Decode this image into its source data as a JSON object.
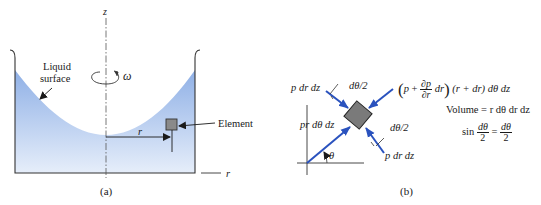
{
  "figure_a": {
    "axis_z_label": "z",
    "omega_label": "ω",
    "liquid_surface_label_line1": "Liquid",
    "liquid_surface_label_line2": "surface",
    "element_label": "Element",
    "radius_label": "r",
    "r_axis_label": "r",
    "caption": "(a)",
    "colors": {
      "liquid_top": "#8fb0e6",
      "liquid_bottom": "#e6eefa",
      "element_fill": "#8a8a8a",
      "outline": "#333333"
    }
  },
  "figure_b": {
    "force_upper_left": "p dr dz",
    "angle_upper": "dθ/2",
    "force_radial_inner": "pr dθ dz",
    "angle_lower": "dθ/2",
    "force_lower_right": "p dr dz",
    "theta_label": "θ",
    "outer_force": {
      "p": "p",
      "plus": "+",
      "partial_num": "∂p",
      "partial_den": "∂r",
      "dr": "dr",
      "rest": "(r + dr) dθ  dz"
    },
    "volume_equation": "Volume = r dθ dr dz",
    "sin_equation": {
      "sin": "sin",
      "lhs_num": "dθ",
      "lhs_den": "2",
      "equals": "=",
      "rhs_num": "dθ",
      "rhs_den": "2"
    },
    "caption": "(b)",
    "colors": {
      "arrow": "#2a52be",
      "element_fill": "#7a7a7a"
    }
  }
}
